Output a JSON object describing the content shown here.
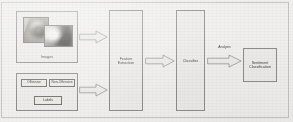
{
  "figure": {
    "type": "pipeline-flowchart",
    "background_color": "#f3f2f0",
    "line_color": "#8d8d8b",
    "text_color": "#3a3a38"
  },
  "inputs": {
    "images": {
      "label": "Images",
      "photos": [
        {
          "name": "photo-thumbnail-left",
          "description": "grayscale photograph"
        },
        {
          "name": "photo-thumbnail-right",
          "description": "grayscale photograph overlapping"
        }
      ]
    },
    "labels": {
      "label": "Labels",
      "classes": [
        {
          "label": "Offensive"
        },
        {
          "label": "Non-Offensive"
        }
      ]
    }
  },
  "stages": [
    {
      "id": "feature-extraction",
      "label": "Feature Extraction"
    },
    {
      "id": "classifier",
      "label": "Classifier"
    },
    {
      "id": "sentiment-classification",
      "label": "Sentiment\nClassification"
    }
  ],
  "edges": [
    {
      "id": "arrow-images",
      "from": "Images",
      "to": "Feature Extraction",
      "label": ""
    },
    {
      "id": "arrow-labels",
      "from": "Labels",
      "to": "Feature Extraction",
      "label": ""
    },
    {
      "id": "arrow-features",
      "from": "Feature Extraction",
      "to": "Classifier",
      "label": ""
    },
    {
      "id": "arrow-output",
      "from": "Classifier",
      "to": "Sentiment Classification",
      "label": "Analysis"
    }
  ]
}
